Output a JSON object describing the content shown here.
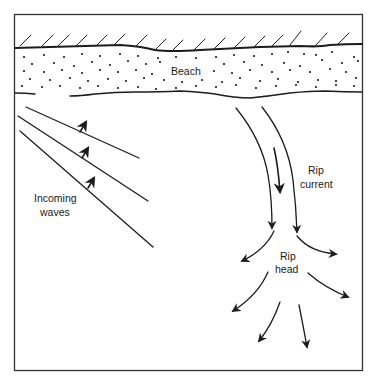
{
  "diagram": {
    "labels": {
      "beach": "Beach",
      "incoming_waves_line1": "Incoming",
      "incoming_waves_line2": "waves",
      "rip_current_line1": "Rip",
      "rip_current_line2": "current",
      "rip_head_line1": "Rip",
      "rip_head_line2": "head"
    },
    "colors": {
      "ink": "#1c1c1c",
      "background": "#ffffff"
    },
    "elements": {
      "frame": "rectangular border",
      "land": "hatched shoreline above beach",
      "beach": "dotted sand band",
      "incoming_waves": 3,
      "rip_current_arrows": 3,
      "rip_head_arrows": 6
    }
  }
}
